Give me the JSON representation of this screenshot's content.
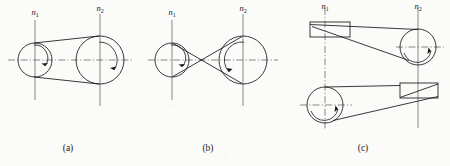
{
  "figure": {
    "background_color": "#fbfbfa",
    "line_color": "#161616",
    "centerline_color": "#3a3a3a"
  },
  "panels": [
    {
      "id": "a",
      "caption": "(a)",
      "name": "open-belt-drive",
      "driver_label": "n",
      "driver_subscript": "1",
      "driven_label": "n",
      "driven_subscript": "2",
      "rotation_sense": "same-direction",
      "driver": {
        "cx": 35,
        "cy": 60,
        "r": 17
      },
      "driven": {
        "cx": 100,
        "cy": 60,
        "r": 24
      }
    },
    {
      "id": "b",
      "caption": "(b)",
      "name": "crossed-belt-drive",
      "driver_label": "n",
      "driver_subscript": "1",
      "driven_label": "n",
      "driven_subscript": "2",
      "rotation_sense": "opposite-direction",
      "driver": {
        "cx": 172,
        "cy": 60,
        "r": 17
      },
      "driven": {
        "cx": 243,
        "cy": 60,
        "r": 24
      }
    },
    {
      "id": "c",
      "caption": "(c)",
      "name": "half-crossed-belt-drive",
      "driver_label": "n",
      "driver_subscript": "1",
      "driven_label": "n",
      "driven_subscript": "2",
      "rotation_sense": "perpendicular-shafts",
      "top_pulley_edge_view": {
        "x": 310,
        "y": 22,
        "w": 40,
        "h": 15
      },
      "top_pulley_face_view": {
        "cx": 418,
        "cy": 47,
        "r": 18
      },
      "bottom_pulley_face_view": {
        "cx": 325,
        "cy": 105,
        "r": 18
      },
      "bottom_pulley_edge_view": {
        "x": 400,
        "y": 83,
        "w": 38,
        "h": 15
      }
    }
  ]
}
